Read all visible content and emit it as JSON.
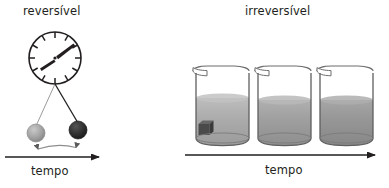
{
  "figure": {
    "title_left": "reversível",
    "title_right": "irreversível",
    "axis_label_left": "tempo",
    "axis_label_right": "tempo",
    "background_color": "#ffffff",
    "ink_color": "#231f20"
  },
  "left_panel": {
    "label": "reversível",
    "axis_label": "tempo",
    "clock": {
      "name": "analog-clock",
      "center_x": 55,
      "center_y": 58,
      "radius": 26,
      "tick_count": 12,
      "hand_minute_angle_deg": 55,
      "hand_hour_angle_deg": 235,
      "face_color": "#ffffff",
      "rim_color": "#231f20"
    },
    "pendulum": {
      "pivot_x": 55,
      "pivot_y": 85,
      "ball_left": {
        "name": "pendulum-ball-light",
        "cx": 36,
        "cy": 133,
        "r": 9,
        "color": "#9a9a9a"
      },
      "ball_right": {
        "name": "pendulum-ball-dark",
        "cx": 78,
        "cy": 130,
        "r": 9,
        "color": "#2c2c2c"
      },
      "swing_arrow": "double-headed-curved-arrow"
    },
    "time_arrow": {
      "x1": 5,
      "y1": 157,
      "x2": 103,
      "y2": 157,
      "direction": "right"
    }
  },
  "right_panel": {
    "label": "irreversível",
    "axis_label": "tempo",
    "beakers": [
      {
        "name": "beaker-1",
        "x": 190,
        "liquid_top": 98,
        "liquid_color_top": "#b3b3b3",
        "liquid_color_bottom": "#9c9c9c",
        "has_solid_cube": true,
        "cube_color": "#4a4a4a"
      },
      {
        "name": "beaker-2",
        "x": 252,
        "liquid_top": 100,
        "liquid_color_top": "#a8a8a8",
        "liquid_color_bottom": "#8f8f8f",
        "has_solid_cube": false,
        "cube_color": ""
      },
      {
        "name": "beaker-3",
        "x": 314,
        "liquid_top": 100,
        "liquid_color_top": "#9e9e9e",
        "liquid_color_bottom": "#8a8a8a",
        "has_solid_cube": false,
        "cube_color": ""
      }
    ],
    "time_arrow": {
      "x1": 185,
      "y1": 155,
      "x2": 379,
      "y2": 155,
      "direction": "right"
    }
  }
}
